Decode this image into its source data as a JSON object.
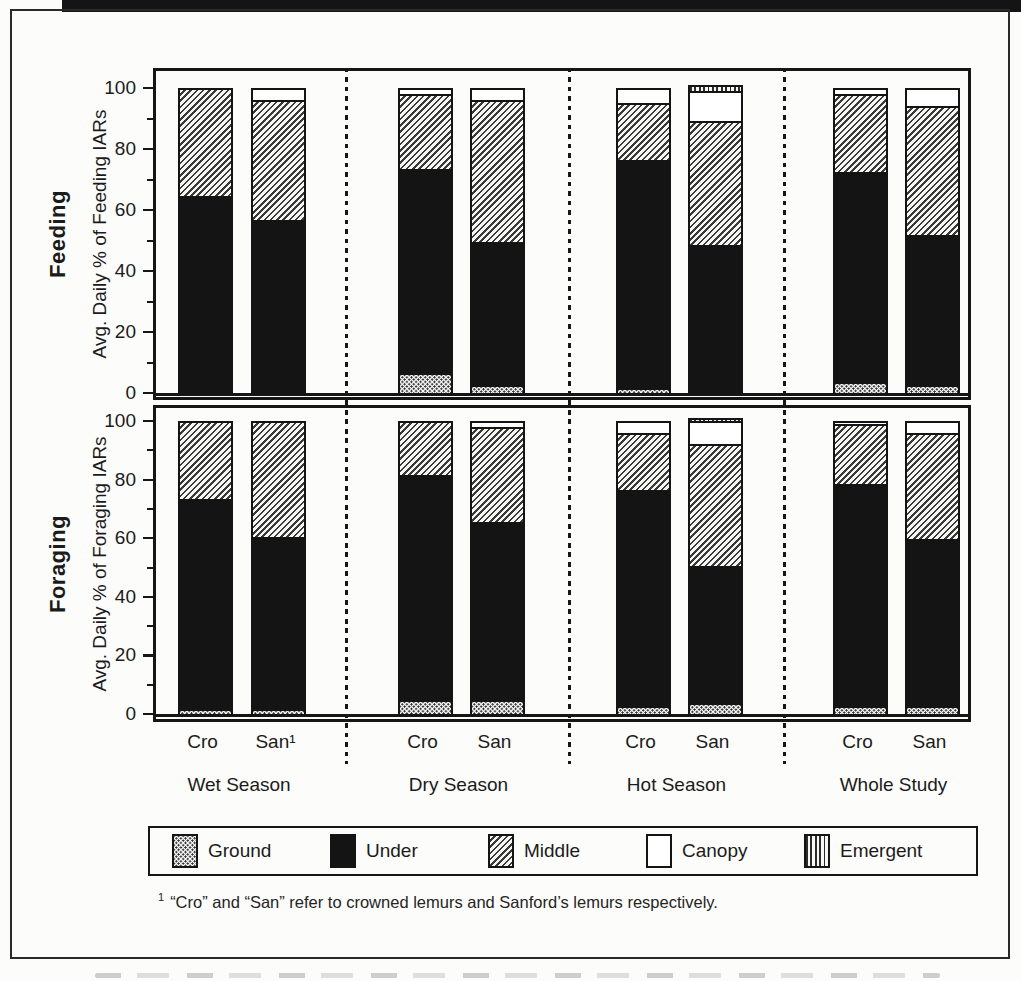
{
  "page": {
    "paper": "#fcfcfa",
    "ink": "#161616"
  },
  "legend": {
    "items": [
      {
        "key": "ground",
        "label": "Ground"
      },
      {
        "key": "under",
        "label": "Under"
      },
      {
        "key": "middle",
        "label": "Middle"
      },
      {
        "key": "canopy",
        "label": "Canopy"
      },
      {
        "key": "emergent",
        "label": "Emergent"
      }
    ]
  },
  "footnote": {
    "marker": "1",
    "text": "“Cro” and “San” refer to crowned lemurs and Sanford’s lemurs respectively."
  },
  "chart_data": {
    "type": "bar",
    "stacked": true,
    "orientation": "vertical",
    "strata": [
      "Ground",
      "Under",
      "Middle",
      "Canopy",
      "Emergent"
    ],
    "units": "percent",
    "yticks": [
      0,
      20,
      40,
      60,
      80,
      100
    ],
    "minor_yticks": [
      10,
      30,
      50,
      70,
      90
    ],
    "ylim": [
      0,
      105
    ],
    "grid": false,
    "legend_position": "bottom",
    "panels": [
      {
        "title": "Feeding",
        "ylabel": "Avg. Daily % of Feeding IARs",
        "groups": [
          {
            "season": "Wet Season",
            "bars": [
              {
                "label": "Cro",
                "values": [
                  0,
                  65,
                  35,
                  0,
                  0
                ]
              },
              {
                "label": "San¹",
                "values": [
                  0,
                  57,
                  39,
                  4,
                  0
                ]
              }
            ]
          },
          {
            "season": "Dry Season",
            "bars": [
              {
                "label": "Cro",
                "values": [
                  6,
                  68,
                  24,
                  2,
                  0
                ]
              },
              {
                "label": "San",
                "values": [
                  2,
                  48,
                  46,
                  4,
                  0
                ]
              }
            ]
          },
          {
            "season": "Hot Season",
            "bars": [
              {
                "label": "Cro",
                "values": [
                  1,
                  76,
                  18,
                  5,
                  0
                ]
              },
              {
                "label": "San",
                "values": [
                  0,
                  49,
                  40,
                  10,
                  2
                ]
              }
            ]
          },
          {
            "season": "Whole Study",
            "bars": [
              {
                "label": "Cro",
                "values": [
                  3,
                  70,
                  25,
                  2,
                  0
                ]
              },
              {
                "label": "San",
                "values": [
                  2,
                  50,
                  42,
                  6,
                  0
                ]
              }
            ]
          }
        ]
      },
      {
        "title": "Foraging",
        "ylabel": "Avg. Daily % of Foraging IARs",
        "groups": [
          {
            "season": "Wet Season",
            "bars": [
              {
                "label": "Cro",
                "values": [
                  1,
                  73,
                  26,
                  0,
                  0
                ]
              },
              {
                "label": "San¹",
                "values": [
                  1,
                  60,
                  39,
                  0,
                  0
                ]
              }
            ]
          },
          {
            "season": "Dry Season",
            "bars": [
              {
                "label": "Cro",
                "values": [
                  4,
                  78,
                  18,
                  0,
                  0
                ]
              },
              {
                "label": "San",
                "values": [
                  4,
                  62,
                  32,
                  2,
                  0
                ]
              }
            ]
          },
          {
            "season": "Hot Season",
            "bars": [
              {
                "label": "Cro",
                "values": [
                  2,
                  75,
                  19,
                  4,
                  0
                ]
              },
              {
                "label": "San",
                "values": [
                  3,
                  48,
                  41,
                  8,
                  1
                ]
              }
            ]
          },
          {
            "season": "Whole Study",
            "bars": [
              {
                "label": "Cro",
                "values": [
                  2,
                  77,
                  20,
                  1,
                  0
                ]
              },
              {
                "label": "San",
                "values": [
                  2,
                  58,
                  36,
                  4,
                  0
                ]
              }
            ]
          }
        ]
      }
    ]
  }
}
